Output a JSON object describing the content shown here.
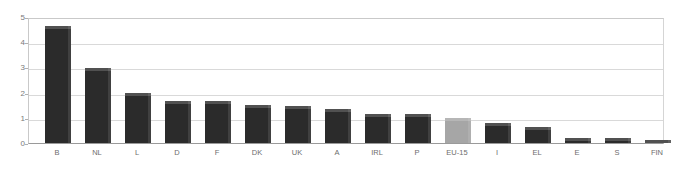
{
  "chart_data": {
    "type": "bar",
    "title": "",
    "subtitle": "",
    "xlabel": "",
    "ylabel": "",
    "ylim": [
      0,
      5
    ],
    "y_ticks": [
      0,
      1,
      2,
      3,
      4,
      5
    ],
    "y_tick_labels": [
      "0",
      "1",
      "2",
      "3",
      "4",
      "5"
    ],
    "grid": true,
    "legend": false,
    "legend_position": "none",
    "categories": [
      "B",
      "NL",
      "L",
      "D",
      "F",
      "DK",
      "UK",
      "A",
      "IRL",
      "P",
      "EU-15",
      "I",
      "EL",
      "E",
      "S",
      "FIN"
    ],
    "values": [
      4.65,
      2.98,
      1.98,
      1.68,
      1.65,
      1.5,
      1.45,
      1.33,
      1.17,
      1.15,
      1.0,
      0.78,
      0.62,
      0.2,
      0.18,
      0.13
    ],
    "bar_colors": {
      "default": "#2b2b2b",
      "highlight": "#a6a6a6"
    },
    "highlight_category": "EU-15",
    "annotations": []
  },
  "axis": {
    "y_min_label": "0",
    "y_max_label": "5"
  }
}
